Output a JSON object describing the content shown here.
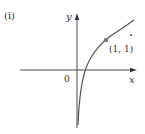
{
  "figure": {
    "panel_label": "(i)",
    "axes": {
      "x_label": "x",
      "y_label": "y",
      "origin_label": "0"
    },
    "curve": {
      "description": "logarithmic-type curve y = log_b(x), passing through (1, 1), vertical asymptote at x = 0 side",
      "color": "#555555"
    },
    "point": {
      "label": "(1, 1)",
      "color": "#777777"
    },
    "annotation_dot": "."
  },
  "colors": {
    "axis": "#333333",
    "curve": "#555555",
    "point": "#7a7a7a",
    "text": "#333333"
  }
}
